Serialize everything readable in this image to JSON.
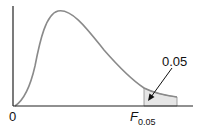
{
  "diagram": {
    "type": "F-distribution density curve with shaded right tail",
    "origin_label": "0",
    "critical_label_main": "F",
    "critical_label_sub": "0.05",
    "tail_area_label": "0.05",
    "colors": {
      "curve": "#8a8a8a",
      "axis": "#222222",
      "shade": "#e6e6e6",
      "arrow": "#111111"
    }
  }
}
